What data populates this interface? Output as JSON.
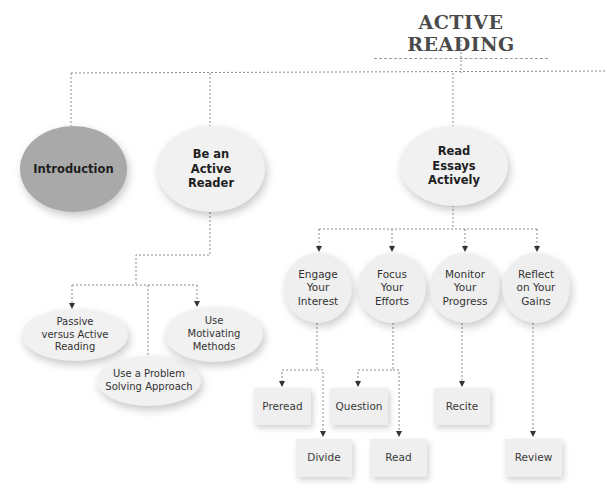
{
  "diagram": {
    "title": "ACTIVE READING",
    "colors": {
      "background": "#ffffff",
      "node_light": "#f1f1f1",
      "node_dark": "#a9a9a9",
      "connector": "#8a8a8a",
      "text": "#2b2b2b"
    },
    "level1": [
      {
        "id": "introduction",
        "label": "Introduction",
        "style": "dark"
      },
      {
        "id": "be-active-reader",
        "label": "Be an\nActive\nReader",
        "style": "light"
      },
      {
        "id": "read-essays-actively",
        "label": "Read\nEssays\nActively",
        "style": "light"
      }
    ],
    "be_active_reader_children": [
      {
        "id": "passive-vs-active",
        "label": "Passive\nversus Active\nReading"
      },
      {
        "id": "problem-solving",
        "label": "Use a Problem\nSolving Approach"
      },
      {
        "id": "motivating-methods",
        "label": "Use\nMotivating\nMethods"
      }
    ],
    "read_essays_children": [
      {
        "id": "engage",
        "label": "Engage\nYour\nInterest",
        "children": [
          "Preread",
          "Divide"
        ]
      },
      {
        "id": "focus",
        "label": "Focus\nYour\nEfforts",
        "children": [
          "Question",
          "Read"
        ]
      },
      {
        "id": "monitor",
        "label": "Monitor\nYour\nProgress",
        "children": [
          "Recite"
        ]
      },
      {
        "id": "reflect",
        "label": "Reflect\non Your\nGains",
        "children": [
          "Review"
        ]
      }
    ],
    "leaves": {
      "preread": "Preread",
      "divide": "Divide",
      "question": "Question",
      "read": "Read",
      "recite": "Recite",
      "review": "Review"
    }
  }
}
